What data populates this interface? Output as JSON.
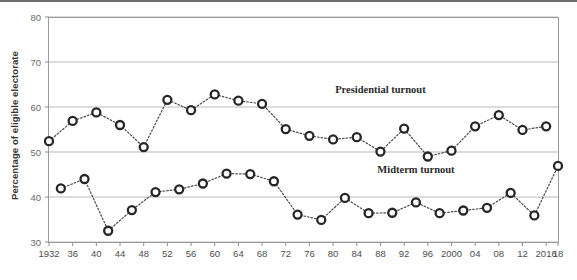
{
  "figure": {
    "ylabel": "Percentage of eligible electorate"
  },
  "chart_data": {
    "type": "line",
    "title": "",
    "subtitle": "",
    "xlabel": "",
    "ylabel": "Percentage of eligible electorate",
    "ylim": [
      30,
      80
    ],
    "yticks": [
      30,
      40,
      50,
      60,
      70,
      80
    ],
    "ytick_labels": [
      "30",
      "40",
      "50",
      "60",
      "70",
      "80"
    ],
    "xlim": [
      1932,
      2018
    ],
    "grid": true,
    "legend_position": "inline-annotation",
    "annotations": [
      {
        "text": "Presidential turnout",
        "x": 1988,
        "y": 63.2
      },
      {
        "text": "Midterm turnout",
        "x": 1994,
        "y": 45.4
      }
    ],
    "xtick_years": [
      1932,
      1936,
      1940,
      1944,
      1948,
      1952,
      1956,
      1960,
      1964,
      1968,
      1972,
      1976,
      1980,
      1984,
      1988,
      1992,
      1996,
      2000,
      2004,
      2008,
      2012,
      2016,
      2018
    ],
    "xtick_labels": [
      "1932",
      "36",
      "40",
      "44",
      "48",
      "52",
      "56",
      "60",
      "64",
      "68",
      "72",
      "76",
      "80",
      "84",
      "88",
      "92",
      "96",
      "2000",
      "04",
      "08",
      "12",
      "2016",
      "18"
    ],
    "series": [
      {
        "name": "Presidential turnout",
        "x": [
          1932,
          1936,
          1940,
          1944,
          1948,
          1952,
          1956,
          1960,
          1964,
          1968,
          1972,
          1976,
          1980,
          1984,
          1988,
          1992,
          1996,
          2000,
          2004,
          2008,
          2012,
          2016
        ],
        "values": [
          52.4,
          56.9,
          58.8,
          56.0,
          51.1,
          61.6,
          59.3,
          62.8,
          61.4,
          60.7,
          55.1,
          53.6,
          52.8,
          53.3,
          50.1,
          55.2,
          49.0,
          50.3,
          55.7,
          58.2,
          54.9,
          55.7
        ]
      },
      {
        "name": "Midterm turnout",
        "x": [
          1934,
          1938,
          1942,
          1946,
          1950,
          1954,
          1958,
          1962,
          1966,
          1970,
          1974,
          1978,
          1982,
          1986,
          1990,
          1994,
          1998,
          2002,
          2006,
          2010,
          2014,
          2018
        ],
        "values": [
          41.9,
          44.0,
          32.5,
          37.1,
          41.1,
          41.7,
          43.0,
          45.2,
          45.1,
          43.5,
          36.1,
          34.9,
          39.8,
          36.4,
          36.5,
          38.8,
          36.4,
          37.0,
          37.6,
          40.9,
          35.9,
          46.9
        ]
      }
    ]
  }
}
